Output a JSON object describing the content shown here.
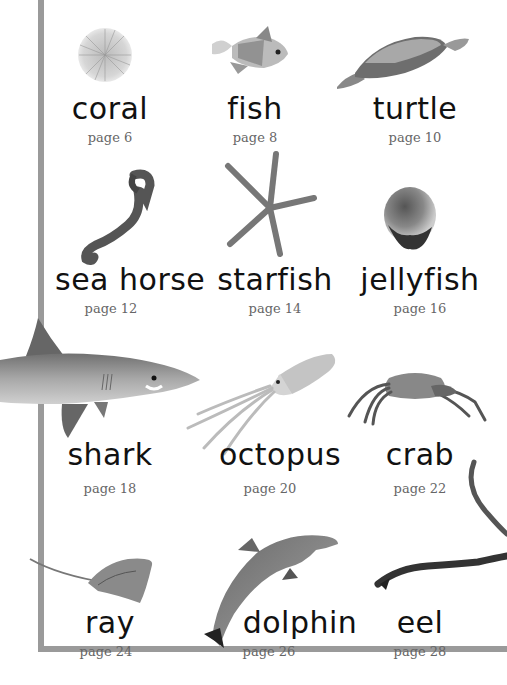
{
  "animals": [
    {
      "name": "coral",
      "page": "page 6",
      "icon": "coral-icon"
    },
    {
      "name": "fish",
      "page": "page 8",
      "icon": "fish-icon"
    },
    {
      "name": "turtle",
      "page": "page 10",
      "icon": "turtle-icon"
    },
    {
      "name": "sea horse",
      "page": "page 12",
      "icon": "seahorse-icon"
    },
    {
      "name": "starfish",
      "page": "page 14",
      "icon": "starfish-icon"
    },
    {
      "name": "jellyfish",
      "page": "page 16",
      "icon": "jellyfish-icon"
    },
    {
      "name": "shark",
      "page": "page 18",
      "icon": "shark-icon"
    },
    {
      "name": "octopus",
      "page": "page 20",
      "icon": "octopus-icon"
    },
    {
      "name": "crab",
      "page": "page 22",
      "icon": "crab-icon"
    },
    {
      "name": "ray",
      "page": "page 24",
      "icon": "ray-icon"
    },
    {
      "name": "dolphin",
      "page": "page 26",
      "icon": "dolphin-icon"
    },
    {
      "name": "eel",
      "page": "page 28",
      "icon": "eel-icon"
    }
  ],
  "colors": {
    "frame": "#9a9a9a",
    "title_text": "#111111",
    "page_text": "#666666"
  }
}
